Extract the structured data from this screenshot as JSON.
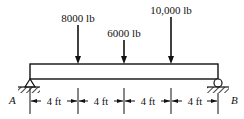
{
  "diagram": {
    "type": "simply-supported-beam",
    "beam": {
      "length_ft": 16,
      "left_support": "pin",
      "right_support": "roller"
    },
    "supports": [
      {
        "label": "A",
        "type": "pin",
        "position_ft": 0
      },
      {
        "label": "B",
        "type": "roller",
        "position_ft": 16
      }
    ],
    "loads": [
      {
        "label": "8000 lb",
        "value_lb": 8000,
        "position_ft": 4
      },
      {
        "label": "6000 lb",
        "value_lb": 6000,
        "position_ft": 8
      },
      {
        "label": "10,000 lb",
        "value_lb": 10000,
        "position_ft": 12
      }
    ],
    "dimensions": [
      {
        "label": "4 ft"
      },
      {
        "label": "4 ft"
      },
      {
        "label": "4 ft"
      },
      {
        "label": "4 ft"
      }
    ],
    "colors": {
      "line": "#111111",
      "background": "#ffffff"
    }
  }
}
